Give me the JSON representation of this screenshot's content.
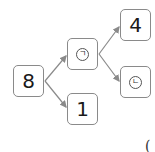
{
  "diagram": {
    "type": "number-decomposition-tree",
    "nodes": [
      {
        "id": "root",
        "label": "8"
      },
      {
        "id": "a",
        "label": "ㄱ",
        "circled": true
      },
      {
        "id": "b",
        "label": "1"
      },
      {
        "id": "c",
        "label": "4"
      },
      {
        "id": "d",
        "label": "ㄴ",
        "circled": true
      }
    ],
    "edges": [
      {
        "from": "root",
        "to": "a"
      },
      {
        "from": "root",
        "to": "b"
      },
      {
        "from": "a",
        "to": "c"
      },
      {
        "from": "a",
        "to": "d"
      }
    ],
    "trailing_text": "("
  },
  "colors": {
    "border": "#8a8a8a",
    "arrow": "#8a8a8a",
    "text": "#1a1a1a"
  }
}
